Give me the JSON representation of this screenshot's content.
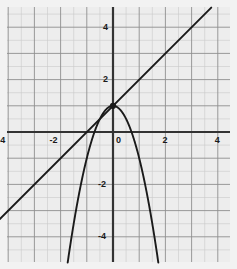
{
  "figure": {
    "title": "",
    "background_color": "#f2f2f2",
    "plot_background_color": "#ededed"
  },
  "chart_data": {
    "type": "line",
    "title": "",
    "xlabel": "",
    "ylabel": "",
    "xlim": [
      -4.35,
      4.75
    ],
    "ylim": [
      -4.85,
      4.85
    ],
    "grid": true,
    "grid_major_step": 1,
    "grid_minor_step": 0.5,
    "legend": "none",
    "axis_color": "#333333",
    "curve_color": "#1a1a1a",
    "x_ticks": [
      -4,
      -2,
      0,
      2,
      4
    ],
    "x_tick_labels": [
      "-4",
      "-2",
      "0",
      "2",
      "4"
    ],
    "y_ticks": [
      -4,
      -2,
      2,
      4
    ],
    "y_tick_labels": [
      "-4",
      "-2",
      "2",
      "4"
    ],
    "series": [
      {
        "name": "parabola",
        "equation": "y = 1 - 2x^2",
        "type": "curve",
        "color": "#1a1a1a",
        "a": -2,
        "b": 0,
        "c": 1,
        "points": [
          {
            "x": -1.6,
            "y": -4.12
          },
          {
            "x": -1.4,
            "y": -2.92
          },
          {
            "x": -1.2,
            "y": -1.88
          },
          {
            "x": -1.0,
            "y": -1.0
          },
          {
            "x": -0.8,
            "y": -0.28
          },
          {
            "x": -0.707,
            "y": 0.0
          },
          {
            "x": -0.5,
            "y": 0.5
          },
          {
            "x": -0.25,
            "y": 0.875
          },
          {
            "x": 0.0,
            "y": 1.0
          },
          {
            "x": 0.25,
            "y": 0.875
          },
          {
            "x": 0.5,
            "y": 0.5
          },
          {
            "x": 0.707,
            "y": 0.0
          },
          {
            "x": 0.8,
            "y": -0.28
          },
          {
            "x": 1.0,
            "y": -1.0
          },
          {
            "x": 1.2,
            "y": -1.88
          },
          {
            "x": 1.4,
            "y": -2.92
          },
          {
            "x": 1.6,
            "y": -4.12
          },
          {
            "x": 1.7,
            "y": -4.78
          }
        ]
      },
      {
        "name": "tangent-line",
        "equation": "y = x + 1",
        "type": "line",
        "color": "#1a1a1a",
        "slope": 1,
        "intercept": 1,
        "x_start": -4.35,
        "x_end": 3.75,
        "y_start": -3.35,
        "y_end": 4.75
      }
    ],
    "markers": [
      {
        "name": "tangent-point",
        "x": 0,
        "y": 1,
        "color": "#1a1a1a",
        "size": 5
      }
    ]
  }
}
